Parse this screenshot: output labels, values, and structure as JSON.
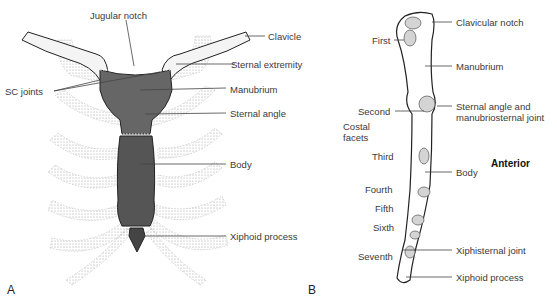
{
  "figure": {
    "panel_a": {
      "letter": "A",
      "labels": {
        "jugular_notch": "Jugular notch",
        "clavicle": "Clavicle",
        "sternal_extremity": "Sternal extremity",
        "sc_joints": "SC joints",
        "manubrium": "Manubrium",
        "sternal_angle": "Sternal angle",
        "body": "Body",
        "xiphoid_process": "Xiphoid process"
      }
    },
    "panel_b": {
      "letter": "B",
      "orientation": "Anterior",
      "labels": {
        "clavicular_notch": "Clavicular notch",
        "first": "First",
        "manubrium": "Manubrium",
        "second": "Second",
        "costal": "Costal",
        "facets": "facets",
        "sternal_angle_line1": "Sternal angle and",
        "sternal_angle_line2": "manubriosternal joint",
        "third": "Third",
        "body": "Body",
        "fourth": "Fourth",
        "fifth": "Fifth",
        "sixth": "Sixth",
        "seventh": "Seventh",
        "xiphisternal_joint": "Xiphisternal joint",
        "xiphoid_process": "Xiphoid process"
      }
    },
    "colors": {
      "sternum_fill": "#5a5a5a",
      "rib_stipple": "#9a9a9a",
      "line": "#444444",
      "bone_outline": "#222222",
      "facet_fill": "#d4d4d4"
    }
  }
}
